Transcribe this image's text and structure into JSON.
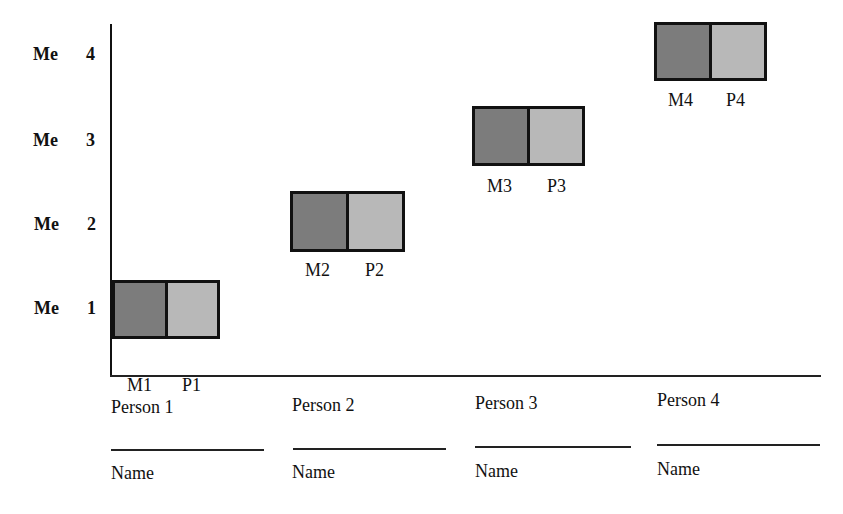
{
  "y_axis": {
    "levels": [
      {
        "prefix": "Me",
        "number": "4"
      },
      {
        "prefix": "Me",
        "number": "3"
      },
      {
        "prefix": "Me",
        "number": "2"
      },
      {
        "prefix": "Me",
        "number": "1"
      }
    ]
  },
  "boxes": [
    {
      "m_label": "M1",
      "p_label": "P1"
    },
    {
      "m_label": "M2",
      "p_label": "P2"
    },
    {
      "m_label": "M3",
      "p_label": "P3"
    },
    {
      "m_label": "M4",
      "p_label": "P4"
    }
  ],
  "persons": [
    {
      "label": "Person 1",
      "name_label": "Name"
    },
    {
      "label": "Person 2",
      "name_label": "Name"
    },
    {
      "label": "Person 3",
      "name_label": "Name"
    },
    {
      "label": "Person 4",
      "name_label": "Name"
    }
  ],
  "colors": {
    "m_fill": "#7c7c7c",
    "p_fill": "#b8b8b8",
    "stroke": "#111111"
  }
}
